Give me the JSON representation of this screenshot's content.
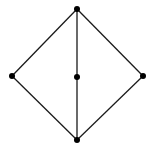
{
  "diagram": {
    "type": "graph",
    "stroke_color": "#1a1a1a",
    "node_color": "#000000",
    "node_radius": 3,
    "stroke_width": 1.3,
    "nodes": [
      {
        "id": "top",
        "x": 77,
        "y": 9
      },
      {
        "id": "left",
        "x": 12,
        "y": 76
      },
      {
        "id": "center",
        "x": 77,
        "y": 77
      },
      {
        "id": "right",
        "x": 143,
        "y": 76
      },
      {
        "id": "bottom",
        "x": 77,
        "y": 140
      }
    ],
    "edges": [
      [
        "top",
        "left"
      ],
      [
        "top",
        "right"
      ],
      [
        "top",
        "center"
      ],
      [
        "center",
        "bottom"
      ],
      [
        "left",
        "bottom"
      ],
      [
        "right",
        "bottom"
      ]
    ]
  }
}
